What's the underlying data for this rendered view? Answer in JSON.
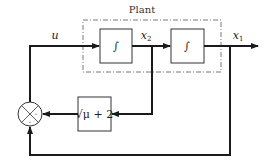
{
  "diagram": {
    "type": "block-diagram",
    "plant": {
      "label": "Plant"
    },
    "signals": {
      "input": "u",
      "state2": "x",
      "state2_sub": "2",
      "output": "x",
      "output_sub": "1"
    },
    "blocks": [
      {
        "id": "integrator-1",
        "label": "∫"
      },
      {
        "id": "integrator-2",
        "label": "∫"
      },
      {
        "id": "feedback-gain",
        "label": "√μ + 2"
      }
    ],
    "summing_junction": {
      "signs": [
        "-",
        "-"
      ]
    },
    "colors": {
      "line": "#1a1a1a",
      "dashed": "#555555",
      "background": "#ffffff"
    }
  }
}
